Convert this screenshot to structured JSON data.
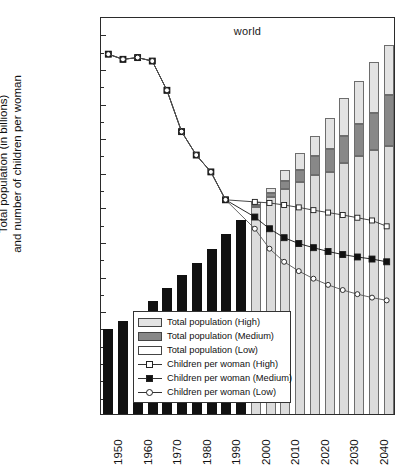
{
  "chart_data": {
    "type": "bar",
    "title": "world",
    "xlabel": "",
    "ylabel": "Total population (in billions) and number of children per woman",
    "ylabel_line1": "Total population (in billions)",
    "ylabel_line2": "and number of children per woman",
    "ylim": [
      0,
      11.5
    ],
    "ymin": 0,
    "ymax": 11.5,
    "ytick_labels": [
      "11.0",
      "10.0",
      "9.0",
      "8.0",
      "7.0",
      "6.0",
      "5.0",
      "4.0",
      "3.0",
      "2.0",
      "1.0"
    ],
    "ytick_values": [
      11.0,
      10.0,
      9.0,
      8.0,
      7.0,
      6.0,
      5.0,
      4.0,
      3.0,
      2.0,
      1.0
    ],
    "yminor_values": [
      10.5,
      9.5,
      8.5,
      7.5,
      6.5,
      5.5,
      4.5,
      3.5,
      2.5,
      1.5,
      0.5
    ],
    "xlim": [
      1947.5,
      2047.5
    ],
    "xtick_labels": [
      "1950",
      "1960",
      "1970",
      "1980",
      "1990",
      "2000",
      "2010",
      "2020",
      "2030",
      "2040"
    ],
    "xtick_values": [
      1950,
      1960,
      1970,
      1980,
      1990,
      2000,
      2010,
      2020,
      2030,
      2040
    ],
    "grid": false,
    "legend_position": "bottom-right",
    "categories": [
      1950,
      1955,
      1960,
      1965,
      1970,
      1975,
      1980,
      1985,
      1990,
      1995,
      2000,
      2005,
      2010,
      2015,
      2020,
      2025,
      2030,
      2035,
      2040,
      2045
    ],
    "series": [
      {
        "name": "Total population (historical)",
        "type": "bar",
        "color": "#111111",
        "values": [
          2.52,
          2.75,
          3.02,
          3.33,
          3.7,
          4.07,
          4.43,
          4.83,
          5.26,
          5.67,
          null,
          null,
          null,
          null,
          null,
          null,
          null,
          null,
          null,
          null
        ]
      },
      {
        "name": "Total population (Low)",
        "type": "bar-stack-base",
        "color": "#dcdcdc",
        "values": [
          null,
          null,
          null,
          null,
          null,
          null,
          null,
          null,
          null,
          null,
          6.05,
          6.33,
          6.55,
          6.75,
          6.95,
          7.05,
          7.3,
          7.52,
          7.68,
          7.8
        ]
      },
      {
        "name": "Total population (Medium)",
        "type": "bar-stack-mid",
        "color": "#888888",
        "values": [
          null,
          null,
          null,
          null,
          null,
          null,
          null,
          null,
          null,
          null,
          6.1,
          6.45,
          6.8,
          7.1,
          7.5,
          7.72,
          8.1,
          8.45,
          8.75,
          9.27
        ]
      },
      {
        "name": "Total population (High)",
        "type": "bar-stack-top",
        "color": "#e3e3e3",
        "values": [
          null,
          null,
          null,
          null,
          null,
          null,
          null,
          null,
          null,
          null,
          6.17,
          6.6,
          7.1,
          7.6,
          8.1,
          8.62,
          9.18,
          9.68,
          10.22,
          10.72
        ]
      },
      {
        "name": "Children per woman (High)",
        "type": "line",
        "marker": "open-square",
        "color": "#333333",
        "axis_note": "plotted at 2x children per woman",
        "values_plotted": [
          10.45,
          10.3,
          10.35,
          10.25,
          9.4,
          8.2,
          7.52,
          7.03,
          6.22,
          null,
          6.16,
          6.13,
          6.07,
          6.0,
          5.92,
          5.85,
          5.78,
          5.7,
          5.62,
          5.45
        ],
        "values_children": [
          5.23,
          5.15,
          5.18,
          5.13,
          4.7,
          4.1,
          3.76,
          3.52,
          3.11,
          null,
          3.08,
          3.07,
          3.04,
          3.0,
          2.96,
          2.93,
          2.89,
          2.85,
          2.81,
          2.73
        ]
      },
      {
        "name": "Children per woman (Medium)",
        "type": "line",
        "marker": "filled-square",
        "color": "#111111",
        "axis_note": "plotted at 2x children per woman",
        "values_plotted": [
          10.45,
          10.3,
          10.35,
          10.25,
          9.4,
          8.2,
          7.52,
          7.03,
          6.22,
          null,
          5.72,
          5.38,
          5.12,
          4.95,
          4.83,
          4.72,
          4.63,
          4.56,
          4.5,
          4.42
        ],
        "values_children": [
          5.23,
          5.15,
          5.18,
          5.13,
          4.7,
          4.1,
          3.76,
          3.52,
          3.11,
          null,
          2.86,
          2.69,
          2.56,
          2.48,
          2.42,
          2.36,
          2.32,
          2.28,
          2.25,
          2.21
        ]
      },
      {
        "name": "Children per woman (Low)",
        "type": "line",
        "marker": "open-circle",
        "color": "#555555",
        "axis_note": "plotted at 2x children per woman",
        "values_plotted": [
          10.45,
          10.3,
          10.35,
          10.25,
          9.4,
          8.2,
          7.52,
          7.03,
          6.22,
          null,
          5.38,
          4.8,
          4.42,
          4.15,
          3.93,
          3.75,
          3.6,
          3.48,
          3.38,
          3.3
        ],
        "values_children": [
          5.23,
          5.15,
          5.18,
          5.13,
          4.7,
          4.1,
          3.76,
          3.52,
          3.11,
          null,
          2.69,
          2.4,
          2.21,
          2.08,
          1.97,
          1.88,
          1.8,
          1.74,
          1.69,
          1.65
        ]
      }
    ]
  },
  "legend": {
    "items": [
      {
        "label": "Total population (High)",
        "swatch": "high"
      },
      {
        "label": "Total population (Medium)",
        "swatch": "med"
      },
      {
        "label": "Total population (Low)",
        "swatch": "low"
      },
      {
        "label": "Children per woman (High)",
        "swatch": "line-open-square"
      },
      {
        "label": "Children per woman (Medium)",
        "swatch": "line-filled-square"
      },
      {
        "label": "Children per woman (Low)",
        "swatch": "line-open-circle"
      }
    ]
  }
}
